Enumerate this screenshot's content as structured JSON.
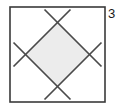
{
  "figure": {
    "kind": "inscribed-square-diagram",
    "side_label": "3",
    "colors": {
      "outer_square_stroke": "#3a3a3a",
      "chord_stroke": "#4a4a4a",
      "diamond_fill": "#ececec",
      "diamond_stroke": "#3f3f3f",
      "background": "#ffffff",
      "label_text": "#1a1a1a"
    },
    "outer_square": {
      "x": 10,
      "y": 7,
      "width": 95,
      "height": 95,
      "stroke_width": 1.6
    },
    "diamond_vertices": [
      {
        "name": "top",
        "x": 57.5,
        "y": 23
      },
      {
        "name": "right",
        "x": 89,
        "y": 54.5
      },
      {
        "name": "bottom",
        "x": 57.5,
        "y": 86
      },
      {
        "name": "left",
        "x": 26,
        "y": 54.5
      }
    ],
    "chords": [
      {
        "name": "chord-top-left-to-bottom-right",
        "x1": 13.5,
        "y1": 42.5,
        "x2": 70.5,
        "y2": 99.5
      },
      {
        "name": "chord-top-right-to-bottom-left",
        "x1": 101.5,
        "y1": 42.5,
        "x2": 44.5,
        "y2": 99.5
      },
      {
        "name": "chord-bottom-left-to-top-right",
        "x1": 13.5,
        "y1": 66.5,
        "x2": 70.5,
        "y2": 9.5
      },
      {
        "name": "chord-bottom-right-to-top-left",
        "x1": 101.5,
        "y1": 66.5,
        "x2": 44.5,
        "y2": 9.5
      }
    ],
    "crossings": [
      {
        "name": "crossing-top",
        "x": 57.5,
        "y": 9.5
      },
      {
        "name": "crossing-right",
        "x": 101.5,
        "y": 54.5
      },
      {
        "name": "crossing-bottom",
        "x": 57.5,
        "y": 99.5
      },
      {
        "name": "crossing-left",
        "x": 13.5,
        "y": 54.5
      }
    ]
  }
}
